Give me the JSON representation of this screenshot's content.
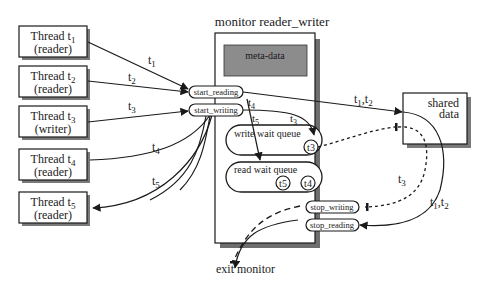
{
  "title": "monitor reader_writer",
  "threads": [
    {
      "id": "t1",
      "name": "Thread t",
      "sub": "1",
      "role": "(reader)"
    },
    {
      "id": "t2",
      "name": "Thread t",
      "sub": "2",
      "role": "(reader)"
    },
    {
      "id": "t3",
      "name": "Thread t",
      "sub": "3",
      "role": "(writer)"
    },
    {
      "id": "t4",
      "name": "Thread t",
      "sub": "4",
      "role": "(reader)"
    },
    {
      "id": "t5",
      "name": "Thread t",
      "sub": "5",
      "role": "(reader)"
    }
  ],
  "monitor": {
    "meta_data": "meta-data",
    "entries": {
      "start_reading": "start_reading",
      "start_writing": "start_writing",
      "stop_writing": "stop_writing",
      "stop_reading": "stop_reading"
    },
    "write_queue": {
      "label": "write wait queue",
      "items": [
        "t3"
      ]
    },
    "read_queue": {
      "label": "read wait queue",
      "items": [
        "t5",
        "t4"
      ]
    }
  },
  "shared": {
    "line1": "shared",
    "line2": "data"
  },
  "exit_label": "exit monitor",
  "edge_labels": {
    "t1": "t",
    "t1_sub": "1",
    "t2": "t",
    "t2_sub": "2",
    "t3": "t",
    "t3_sub": "3",
    "t4": "t",
    "t4_sub": "4",
    "t5": "t",
    "t5_sub": "5",
    "t3_inner": "t",
    "t3_inner_sub": "3",
    "t1t2_top": "t",
    "t1t2_top_a": "1",
    "t1t2_top_sep": ",t",
    "t1t2_top_b": "2",
    "t1t2_right": "t",
    "t1t2_right_a": "1",
    "t1t2_right_sep": ",t",
    "t1t2_right_b": "2",
    "t3_right": "t",
    "t3_right_sub": "3"
  },
  "colors": {
    "meta_fill": "#8c8c8c",
    "shadow": "#6e6e6e",
    "stroke": "#1a1a1a"
  }
}
